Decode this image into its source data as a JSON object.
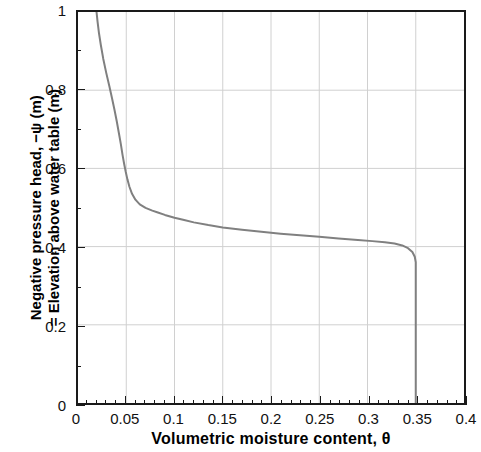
{
  "chart_data": {
    "type": "line",
    "title": "",
    "xlabel": "Volumetric moisture content, θ",
    "ylabel_line1": "Negative pressure head, −ψ (m)",
    "ylabel_line2": "= Elevation above water table (m)",
    "xlim": [
      0,
      0.4
    ],
    "ylim": [
      0,
      1
    ],
    "xticks": [
      0,
      0.05,
      0.1,
      0.15,
      0.2,
      0.25,
      0.3,
      0.35,
      0.4
    ],
    "xticklabels": [
      "0",
      "0.05",
      "0.1",
      "0.15",
      "0.2",
      "0.25",
      "0.3",
      "0.35",
      "0.4"
    ],
    "yticks": [
      0,
      0.2,
      0.4,
      0.6,
      0.8,
      1
    ],
    "yticklabels": [
      "0",
      "0.2",
      "0.4",
      "0.6",
      "0.8",
      "1"
    ],
    "x_minor_step": 0.01,
    "y_minor_step": 0.1,
    "grid": true,
    "grid_color": "#d0d0d0",
    "axis_color": "#1a1a1a",
    "legend": "none",
    "series": [
      {
        "name": "Soil moisture retention profile",
        "color": "#808080",
        "linewidth": 2,
        "points": [
          [
            0.0192,
            1.0
          ],
          [
            0.0203,
            0.975
          ],
          [
            0.0218,
            0.945
          ],
          [
            0.0237,
            0.915
          ],
          [
            0.0262,
            0.88
          ],
          [
            0.0292,
            0.845
          ],
          [
            0.0325,
            0.81
          ],
          [
            0.0352,
            0.78
          ],
          [
            0.0378,
            0.75
          ],
          [
            0.0402,
            0.72
          ],
          [
            0.0424,
            0.69
          ],
          [
            0.0444,
            0.662
          ],
          [
            0.0462,
            0.634
          ],
          [
            0.0478,
            0.612
          ],
          [
            0.0494,
            0.592
          ],
          [
            0.0512,
            0.572
          ],
          [
            0.0533,
            0.553
          ],
          [
            0.056,
            0.535
          ],
          [
            0.0595,
            0.52
          ],
          [
            0.064,
            0.508
          ],
          [
            0.07,
            0.499
          ],
          [
            0.077,
            0.492
          ],
          [
            0.082,
            0.488
          ],
          [
            0.09,
            0.481
          ],
          [
            0.1,
            0.474
          ],
          [
            0.11,
            0.468
          ],
          [
            0.12,
            0.462
          ],
          [
            0.135,
            0.455
          ],
          [
            0.15,
            0.449
          ],
          [
            0.17,
            0.443
          ],
          [
            0.19,
            0.438
          ],
          [
            0.21,
            0.433
          ],
          [
            0.23,
            0.429
          ],
          [
            0.25,
            0.425
          ],
          [
            0.27,
            0.421
          ],
          [
            0.29,
            0.417
          ],
          [
            0.305,
            0.414
          ],
          [
            0.318,
            0.411
          ],
          [
            0.328,
            0.408
          ],
          [
            0.336,
            0.403
          ],
          [
            0.342,
            0.396
          ],
          [
            0.3465,
            0.386
          ],
          [
            0.349,
            0.374
          ],
          [
            0.35,
            0.36
          ],
          [
            0.35,
            0.3
          ],
          [
            0.35,
            0.2
          ],
          [
            0.35,
            0.1
          ],
          [
            0.35,
            0.0
          ]
        ]
      }
    ]
  }
}
